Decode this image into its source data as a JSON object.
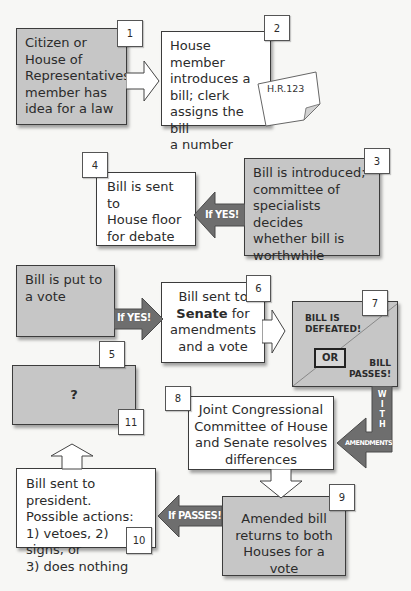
{
  "diagram": {
    "colors": {
      "gray_box": "#c6c6c6",
      "white_box": "#ffffff",
      "arrow_fill": "#6e6e6e",
      "hollow_arrow": "#ffffff"
    },
    "steps": [
      {
        "id": 1,
        "number": "1",
        "text": "Citizen or House of Representatives member has idea for a law",
        "lines": [
          "Citizen or",
          "House of",
          "Representatives",
          "member has",
          "idea for a law"
        ],
        "style": "gray"
      },
      {
        "id": 2,
        "number": "2",
        "lines": [
          "House member",
          "introduces a",
          "bill; clerk",
          "assigns the bill",
          "a number"
        ],
        "style": "white",
        "note": "H.R.123"
      },
      {
        "id": 3,
        "number": "3",
        "lines": [
          "Bill is introduced;",
          "committee of",
          "specialists decides",
          "whether bill is",
          "worthwhile"
        ],
        "style": "gray"
      },
      {
        "id": 4,
        "number": "4",
        "lines": [
          "Bill is sent to",
          "House floor",
          "for debate"
        ],
        "style": "white"
      },
      {
        "id": 5,
        "number": "5",
        "lines": [
          "Bill is put to",
          "a vote"
        ],
        "style": "gray"
      },
      {
        "id": 6,
        "number": "6",
        "lines": [
          "Bill sent to",
          "Senate",
          "for",
          "amendments",
          "and a vote"
        ],
        "style": "white"
      },
      {
        "id": 7,
        "number": "7",
        "defeated": [
          "BILL IS",
          "DEFEATED!"
        ],
        "or": "OR",
        "passes": [
          "BILL",
          "PASSES!"
        ],
        "style": "gray"
      },
      {
        "id": 8,
        "number": "8",
        "lines": [
          "Joint Congressional",
          "Committee of House",
          "and Senate resolves",
          "differences"
        ],
        "style": "white"
      },
      {
        "id": 9,
        "number": "9",
        "lines": [
          "Amended bill",
          "returns to both",
          "Houses for a vote"
        ],
        "style": "gray"
      },
      {
        "id": 10,
        "number": "10",
        "lines": [
          "Bill sent to president.",
          "Possible actions:",
          "1) vetoes, 2) signs, or",
          "3) does nothing"
        ],
        "style": "white"
      },
      {
        "id": 11,
        "number": "11",
        "text": "?",
        "style": "gray"
      }
    ],
    "arrows": [
      {
        "from": 1,
        "to": 2,
        "type": "hollow",
        "label": ""
      },
      {
        "from": 3,
        "to": 4,
        "type": "filled",
        "label": "If YES!"
      },
      {
        "from": 5,
        "to": 6,
        "type": "filled",
        "label": "If YES!"
      },
      {
        "from": 6,
        "to": 7,
        "type": "hollow",
        "label": ""
      },
      {
        "from": 7,
        "to": 8,
        "type": "filled",
        "label_vertical": [
          "W",
          "I",
          "T",
          "H"
        ],
        "label": "AMENDMENTS"
      },
      {
        "from": 8,
        "to": 9,
        "type": "hollow",
        "label": ""
      },
      {
        "from": 9,
        "to": 10,
        "type": "filled",
        "label": "If PASSES!"
      },
      {
        "from": 10,
        "to": 11,
        "type": "hollow",
        "label": ""
      }
    ]
  }
}
